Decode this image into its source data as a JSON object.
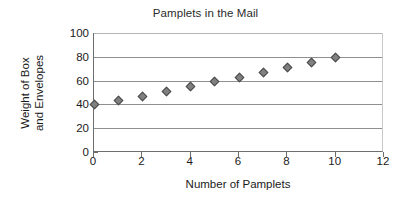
{
  "chart_data": {
    "type": "scatter",
    "title": "Pamplets in the Mail",
    "xlabel": "Number of Pamplets",
    "ylabel_line1": "Weight of Box",
    "ylabel_line2": "and Envelopes",
    "ylabel": "Weight of Box and Envelopes",
    "x": [
      0,
      1,
      2,
      3,
      4,
      5,
      6,
      7,
      8,
      9,
      10
    ],
    "values": [
      40,
      43.5,
      47,
      51,
      55,
      59,
      63,
      66.5,
      71,
      75,
      79.5
    ],
    "xlim": [
      0,
      12
    ],
    "ylim": [
      0,
      100
    ],
    "x_ticks": [
      0,
      2,
      4,
      6,
      8,
      10,
      12
    ],
    "x_tick_labels": [
      "0",
      "2",
      "4",
      "6",
      "8",
      "10",
      "12"
    ],
    "y_ticks": [
      0,
      20,
      40,
      60,
      80,
      100
    ],
    "y_tick_labels": [
      "0",
      "20",
      "40",
      "60",
      "80",
      "100"
    ],
    "grid": "horizontal",
    "legend": "none",
    "marker_shape": "diamond",
    "marker_fill": "#808080",
    "marker_edge": "#4a4a4a",
    "gridline_color": "#8f8f8f",
    "axis_color": "#6e6e6e",
    "background": "#ffffff",
    "text_color": "#1a1a1a"
  }
}
